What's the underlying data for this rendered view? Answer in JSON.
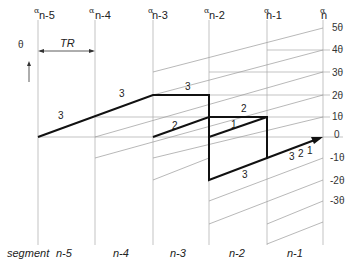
{
  "header": {
    "alphas": [
      {
        "symbol": "α",
        "sub": "n-5"
      },
      {
        "symbol": "α",
        "sub": "n-4"
      },
      {
        "symbol": "α",
        "sub": "n-3"
      },
      {
        "symbol": "α",
        "sub": "n-2"
      },
      {
        "symbol": "α",
        "sub": "n-1"
      },
      {
        "symbol": "α",
        "sub": "n"
      }
    ],
    "theta_axis": "θ",
    "tr_label": "TR"
  },
  "levels": [
    "5θ",
    "4θ",
    "3θ",
    "2θ",
    "1θ",
    "0",
    "-1θ",
    "-2θ",
    "-3θ"
  ],
  "path_labels": {
    "a": "3",
    "b": "3",
    "c": "3",
    "d": "2",
    "e": "2",
    "f": "1",
    "g": "3",
    "h": "3",
    "i": "2",
    "j": "1"
  },
  "footer": {
    "segment_label": "segment",
    "segments": [
      "n-5",
      "n-4",
      "n-3",
      "n-2",
      "n-1"
    ]
  }
}
